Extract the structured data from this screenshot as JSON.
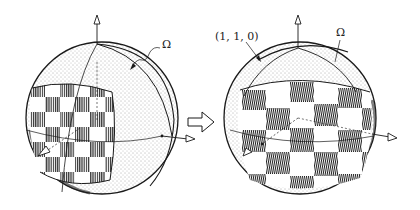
{
  "diagram": {
    "colors": {
      "ink": "#1a1a1a",
      "background": "#ffffff",
      "stipple": "#555555"
    },
    "left_sphere": {
      "labels": {
        "omega": "Ω"
      },
      "axes": [
        "up-arrow",
        "right-arrow",
        "front-left-arrow"
      ]
    },
    "transition_arrow": {
      "icon": "hollow-right-arrow"
    },
    "right_sphere": {
      "labels": {
        "point": "(1, 1, 0)",
        "omega": "Ω"
      },
      "axes": [
        "up-arrow",
        "right-arrow",
        "front-left-arrow"
      ]
    }
  }
}
